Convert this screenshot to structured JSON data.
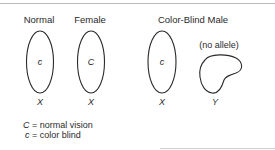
{
  "groups": [
    {
      "title_parts": [
        "Normal",
        "Female"
      ],
      "chromosomes": [
        {
          "type": "X",
          "allele": "c",
          "label": "X"
        },
        {
          "type": "X",
          "allele": "C",
          "label": "X"
        }
      ]
    },
    {
      "title": "Color-Blind Male",
      "chromosomes": [
        {
          "type": "X",
          "allele": "c",
          "label": "X"
        },
        {
          "type": "Y",
          "allele": "(no allele)",
          "label": "Y"
        }
      ]
    }
  ],
  "legend": [
    {
      "symbol": "C",
      "text": "= normal vision"
    },
    {
      "symbol": "c",
      "text": "= color blind"
    }
  ],
  "colors": {
    "outline": "#2a2a2a",
    "text": "#2a2a2a",
    "rule": "#b8b8b8"
  }
}
